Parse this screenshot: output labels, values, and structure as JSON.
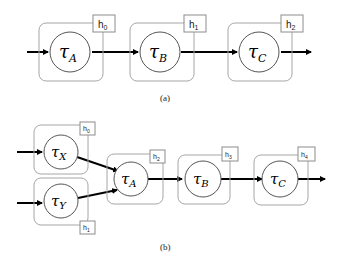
{
  "figure": {
    "panel_a": {
      "caption": "(a)",
      "nodes": [
        {
          "id": "A",
          "symbol": "τ",
          "sub": "A",
          "state_label": "h",
          "state_sub": "0"
        },
        {
          "id": "B",
          "symbol": "τ",
          "sub": "B",
          "state_label": "h",
          "state_sub": "1"
        },
        {
          "id": "C",
          "symbol": "τ",
          "sub": "C",
          "state_label": "h",
          "state_sub": "2"
        }
      ],
      "edges": [
        "in→A",
        "A→B",
        "B→C",
        "C→out"
      ]
    },
    "panel_b": {
      "caption": "(b)",
      "nodes": [
        {
          "id": "X",
          "symbol": "τ",
          "sub": "X",
          "state_label": "h",
          "state_sub": "0"
        },
        {
          "id": "Y",
          "symbol": "τ",
          "sub": "Y",
          "state_label": "h",
          "state_sub": "1"
        },
        {
          "id": "A",
          "symbol": "τ",
          "sub": "A",
          "state_label": "h",
          "state_sub": "2"
        },
        {
          "id": "B",
          "symbol": "τ",
          "sub": "B",
          "state_label": "h",
          "state_sub": "3"
        },
        {
          "id": "C",
          "symbol": "τ",
          "sub": "C",
          "state_label": "h",
          "state_sub": "4"
        }
      ],
      "edges": [
        "in→X",
        "in→Y",
        "X→A",
        "Y→A",
        "A→B",
        "B→C",
        "C→out"
      ]
    }
  }
}
